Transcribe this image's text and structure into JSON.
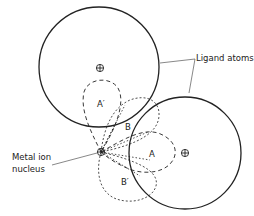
{
  "diagram": {
    "labels": {
      "ligand_atoms": "Ligand atoms",
      "metal_ion_line1": "Metal ion",
      "metal_ion_line2": "nucleus",
      "orbital_a": "A",
      "orbital_a_prime": "A′",
      "orbital_b": "B",
      "orbital_b_prime": "B′"
    },
    "colors": {
      "stroke": "#222222",
      "background": "#ffffff"
    }
  }
}
